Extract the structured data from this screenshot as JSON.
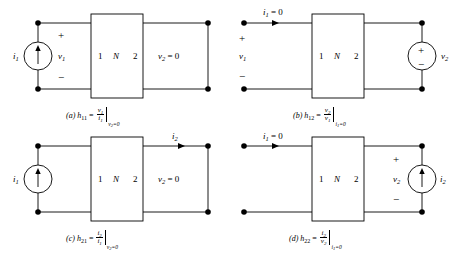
{
  "figure": {
    "name": "h-parameter two-port measurement configurations",
    "stroke_color": "#000000",
    "background_color": "#ffffff",
    "twoport_box": {
      "port1_label": "1",
      "network_label": "N",
      "port2_label": "2"
    }
  },
  "panels": [
    {
      "id": "a",
      "tag": "(a)",
      "source": {
        "type": "current-source",
        "label": "i",
        "sub": "1",
        "arrow": "up",
        "position": "left"
      },
      "input_voltage": {
        "label": "v",
        "sub": "1",
        "plus": "+",
        "minus": "−"
      },
      "output_condition": {
        "var": "v",
        "sub": "2",
        "text": "= 0"
      },
      "caption": {
        "tag": "(a)",
        "param": "h",
        "param_sub": "11",
        "equals": "=",
        "numerator": "v",
        "numerator_sub": "1",
        "denominator": "i",
        "denominator_sub": "1",
        "condition_var": "v",
        "condition_sub": "2",
        "condition_value": "=0"
      }
    },
    {
      "id": "b",
      "tag": "(b)",
      "source": {
        "type": "voltage-source",
        "label": "v",
        "sub": "2",
        "plus": "+",
        "minus": "−",
        "position": "right"
      },
      "input_current": {
        "label": "i",
        "sub": "1",
        "text": "= 0",
        "arrow": "right"
      },
      "input_voltage": {
        "label": "v",
        "sub": "1",
        "plus": "+",
        "minus": "−"
      },
      "caption": {
        "tag": "(b)",
        "param": "h",
        "param_sub": "12",
        "equals": "=",
        "numerator": "v",
        "numerator_sub": "2",
        "denominator": "v",
        "denominator_sub": "1",
        "condition_var": "i",
        "condition_sub": "1",
        "condition_value": "=0"
      }
    },
    {
      "id": "c",
      "tag": "(c)",
      "source": {
        "type": "current-source",
        "label": "i",
        "sub": "1",
        "arrow": "up",
        "position": "left"
      },
      "output_current": {
        "label": "i",
        "sub": "2",
        "arrow": "right"
      },
      "output_condition": {
        "var": "v",
        "sub": "2",
        "text": "= 0"
      },
      "caption": {
        "tag": "(c)",
        "param": "h",
        "param_sub": "21",
        "equals": "=",
        "numerator": "i",
        "numerator_sub": "2",
        "denominator": "i",
        "denominator_sub": "1",
        "condition_var": "v",
        "condition_sub": "2",
        "condition_value": "=0"
      }
    },
    {
      "id": "d",
      "tag": "(d)",
      "source": {
        "type": "current-source",
        "label": "i",
        "sub": "2",
        "arrow": "up",
        "position": "right"
      },
      "input_current": {
        "label": "i",
        "sub": "1",
        "text": "= 0",
        "arrow": "right"
      },
      "output_voltage": {
        "label": "v",
        "sub": "2",
        "plus": "+",
        "minus": "−"
      },
      "caption": {
        "tag": "(d)",
        "param": "h",
        "param_sub": "22",
        "equals": "=",
        "numerator": "i",
        "numerator_sub": "2",
        "denominator": "v",
        "denominator_sub": "2",
        "condition_var": "i",
        "condition_sub": "1",
        "condition_value": "=0"
      }
    }
  ]
}
